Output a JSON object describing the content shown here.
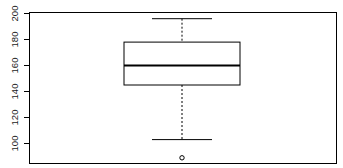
{
  "chart_data": {
    "type": "box",
    "title": "",
    "xlabel": "",
    "ylabel": "",
    "orientation": "vertical",
    "grid": false,
    "legend": null,
    "frame": true,
    "ylim": [
      88,
      204
    ],
    "yticks": [
      100,
      120,
      140,
      160,
      180,
      200
    ],
    "ytick_labels": [
      "100",
      "120",
      "140",
      "160",
      "180",
      "200"
    ],
    "ytick_label_rotation": 90,
    "xticks": [],
    "xtick_labels": [],
    "boxes": [
      {
        "name": "box-1",
        "position": 1,
        "whisker_low": 103,
        "q1": 145,
        "median": 160,
        "q3": 178,
        "whisker_high": 196,
        "outliers": [
          89
        ],
        "box_fill": "#ffffff",
        "box_edge_color": "#000000",
        "median_color": "#000000",
        "whisker_color": "#000000",
        "whisker_style": "dashed",
        "outlier_marker": "circle-open"
      }
    ],
    "colors": {
      "frame": "#000000",
      "axis": "#000000",
      "box_edge": "#000000",
      "median": "#000000",
      "whisker": "#000000",
      "tick_label": "#1a1a1a",
      "background": "#ffffff"
    }
  },
  "axis": {
    "tick_200": "200",
    "tick_180": "180",
    "tick_160": "160",
    "tick_140": "140",
    "tick_120": "120",
    "tick_100": "100"
  }
}
